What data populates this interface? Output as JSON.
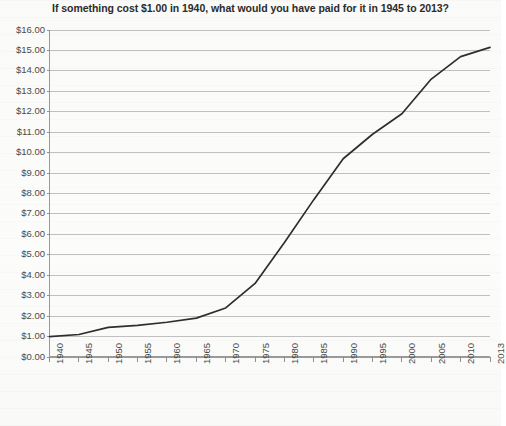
{
  "chart_data": {
    "type": "line",
    "title": "If something cost $1.00 in 1940, what would you have paid for it in 1945 to 2013?",
    "xlabel": "",
    "ylabel": "",
    "ylim": [
      0,
      16
    ],
    "xlim": [
      1940,
      2013
    ],
    "grid": true,
    "legend": false,
    "y_tick_labels": [
      "$16.00",
      "$15.00",
      "$14.00",
      "$13.00",
      "$12.00",
      "$11.00",
      "$10.00",
      "$9.00",
      "$8.00",
      "$7.00",
      "$6.00",
      "$5.00",
      "$4.00",
      "$3.00",
      "$2.00",
      "$1.00",
      "$0.00"
    ],
    "y_tick_values": [
      16,
      15,
      14,
      13,
      12,
      11,
      10,
      9,
      8,
      7,
      6,
      5,
      4,
      3,
      2,
      1,
      0
    ],
    "x_tick_labels": [
      "1940",
      "1945",
      "1950",
      "1955",
      "1960",
      "1965",
      "1970",
      "1975",
      "1980",
      "1985",
      "1990",
      "1995",
      "2000",
      "2005",
      "2010",
      "2013"
    ],
    "x": [
      1940,
      1945,
      1950,
      1955,
      1960,
      1965,
      1970,
      1975,
      1980,
      1985,
      1990,
      1995,
      2000,
      2005,
      2010,
      2013
    ],
    "values": [
      1.0,
      1.1,
      1.45,
      1.55,
      1.7,
      1.9,
      2.4,
      3.6,
      5.6,
      7.7,
      9.7,
      10.9,
      11.9,
      13.6,
      14.7,
      15.15
    ],
    "series_name": "Cumulative cost of $1.00 from 1940",
    "line_color": "#2e2e2e"
  },
  "caption": {
    "fragment": ""
  }
}
